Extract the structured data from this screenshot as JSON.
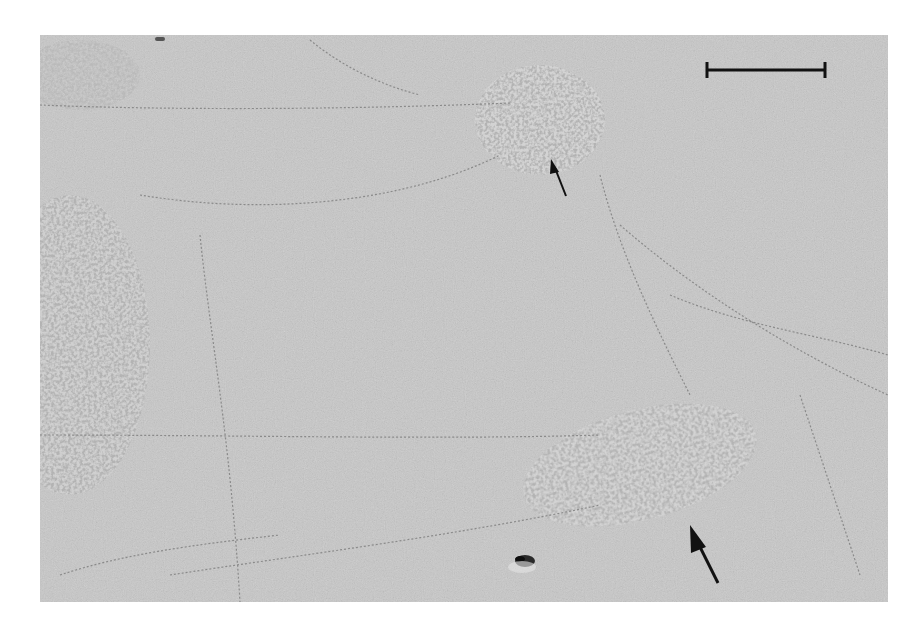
{
  "figure": {
    "type": "electron-micrograph",
    "background_color": "#c9c9c9",
    "frame_color": "#ffffff",
    "scale_bar": {
      "color": "#111111"
    },
    "annotations": [
      {
        "kind": "arrow",
        "size": "small",
        "target": "upper-right-cluster"
      },
      {
        "kind": "arrow",
        "size": "large",
        "target": "lower-right-cluster"
      }
    ],
    "features": [
      "upper-right-granular-cluster",
      "lower-right-granular-cluster",
      "left-edge-granular-region",
      "fibrous-strands",
      "dark-debris-particle"
    ]
  }
}
